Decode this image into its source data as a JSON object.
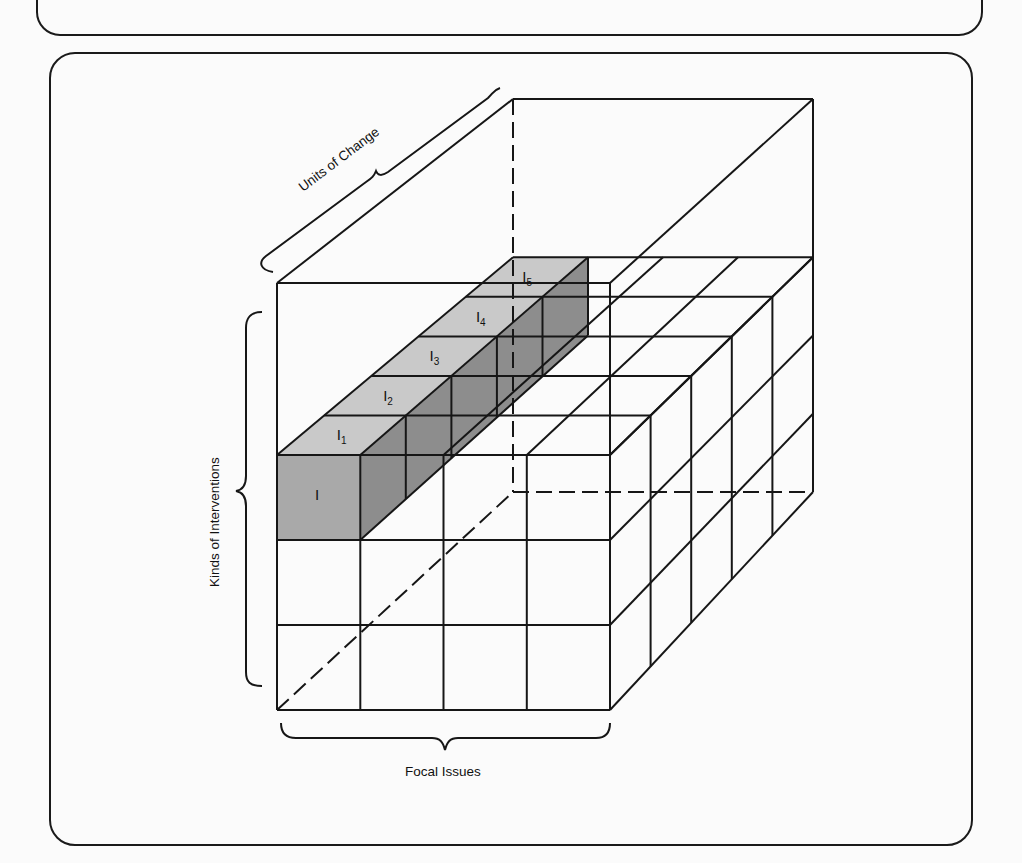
{
  "diagram": {
    "axes": {
      "depth_label": "Units of Change",
      "vertical_label": "Kinds of Interventions",
      "horizontal_label": "Focal Issues"
    },
    "highlighted_column": {
      "front_label": "I",
      "slices": [
        {
          "label": "I",
          "sub": "1"
        },
        {
          "label": "I",
          "sub": "2"
        },
        {
          "label": "I",
          "sub": "3"
        },
        {
          "label": "I",
          "sub": "4"
        },
        {
          "label": "I",
          "sub": "5"
        }
      ]
    },
    "grid": {
      "columns": 4,
      "lower_rows": 3,
      "depth_slices": 5
    },
    "colors": {
      "front_shade": "#a9a9a9",
      "top_shade": "#c9c9c9",
      "side_shade": "#8d8d8d",
      "line": "#161616"
    }
  }
}
